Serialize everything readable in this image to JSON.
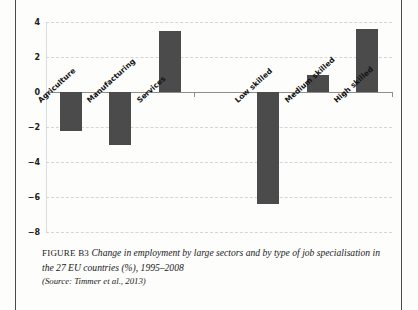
{
  "figure": {
    "label": "FIGURE B3",
    "title": "Change in employment by large sectors and by type of job specialisation in the 27 EU countries (%), 1995–2008",
    "source": "(Source: Timmer et al., 2013)"
  },
  "colors": {
    "bar_fill": "#4b4b4b",
    "gridline": "#cfd6dd",
    "axis": "#8d8d8d",
    "page_rule": "#4b4b4b",
    "text": "#1a1a1a",
    "page_background": "#fdfdfc"
  },
  "chart_data": {
    "type": "bar",
    "title": "",
    "xlabel": "",
    "ylabel": "",
    "categories": [
      "Agriculture",
      "Manufacturing",
      "Services",
      "",
      "Low skilled",
      "Medium skilled",
      "High skilled"
    ],
    "values": [
      -2.2,
      -3.0,
      3.5,
      null,
      -6.4,
      1.0,
      3.6
    ],
    "ylim": [
      -8,
      4
    ],
    "yticks": [
      4,
      2,
      0,
      -2,
      -4,
      -6,
      -8
    ],
    "ytick_labels": [
      "4",
      "2",
      "0",
      "−2",
      "−4",
      "−6",
      "−8"
    ],
    "grid": true,
    "grid_style": "dashed-horizontal",
    "legend": "none",
    "zero_line": 0,
    "series": [
      {
        "name": "Change in employment (%)",
        "points": [
          {
            "category": "Agriculture",
            "value": -2.2
          },
          {
            "category": "Manufacturing",
            "value": -3.0
          },
          {
            "category": "Services",
            "value": 3.5
          },
          {
            "category": "Low skilled",
            "value": -6.4
          },
          {
            "category": "Medium skilled",
            "value": 1.0
          },
          {
            "category": "High skilled",
            "value": 3.6
          }
        ]
      }
    ],
    "groups": [
      {
        "name": "Large sectors",
        "categories": [
          "Agriculture",
          "Manufacturing",
          "Services"
        ]
      },
      {
        "name": "Job specialisation",
        "categories": [
          "Low skilled",
          "Medium skilled",
          "High skilled"
        ]
      }
    ]
  }
}
